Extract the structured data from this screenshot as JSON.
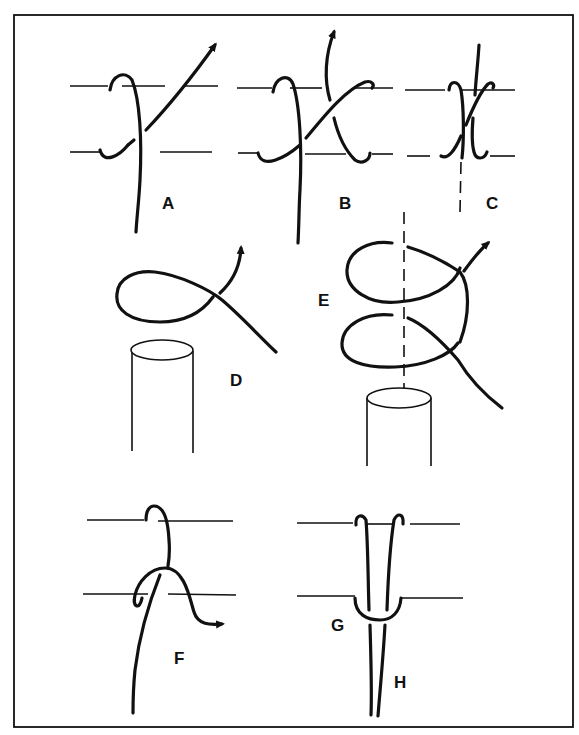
{
  "figure": {
    "type": "knot-tying diagram",
    "panels": [
      {
        "id": "A",
        "label": "A",
        "description": "Strand wrapped around two horizontal bars, crossing diagonally, arrow pointing up-right"
      },
      {
        "id": "B",
        "label": "B",
        "description": "Second wrap added, strand crossing back with arrow pointing up"
      },
      {
        "id": "C",
        "label": "C",
        "description": "Wraps tightened together around bars, dashed center line"
      },
      {
        "id": "D",
        "label": "D",
        "description": "Single loop formed above a cylindrical post, arrow up-right"
      },
      {
        "id": "E",
        "label": "E",
        "description": "Two stacked loops around dashed axis above a cylindrical post, arrow up-right"
      },
      {
        "id": "F",
        "label": "F",
        "description": "Strand hooked over upper bar and looped over lower bar, arrow right"
      },
      {
        "id": "G",
        "label": "G",
        "description": "Loop around lower bar binding two strands"
      },
      {
        "id": "H",
        "label": "H",
        "description": "Two parallel strands hooked over upper bar descending downward"
      }
    ]
  }
}
